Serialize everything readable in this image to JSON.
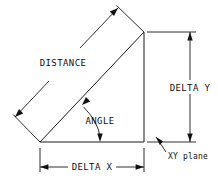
{
  "diagram": {
    "type": "engineering-dimension-diagram",
    "background_color": "#ffffff",
    "line_color": "#1a1a1a",
    "labels": {
      "distance": "DISTANCE",
      "angle": "ANGLE",
      "delta_y": "DELTA Y",
      "delta_x": "DELTA X",
      "xy_plane": "XY plane"
    },
    "geometry": {
      "triangle_vertices": [
        {
          "name": "origin",
          "x": 40,
          "y": 142
        },
        {
          "name": "corner",
          "x": 144,
          "y": 142
        },
        {
          "name": "endpoint",
          "x": 144,
          "y": 32
        }
      ],
      "distance_dimension": {
        "from_x": 15,
        "from_y": 117,
        "to_x": 118,
        "to_y": 8
      },
      "delta_y_dimension": {
        "x": 190,
        "from_y": 32,
        "to_y": 142
      },
      "delta_x_dimension": {
        "y": 167,
        "from_x": 40,
        "to_x": 144
      }
    }
  }
}
